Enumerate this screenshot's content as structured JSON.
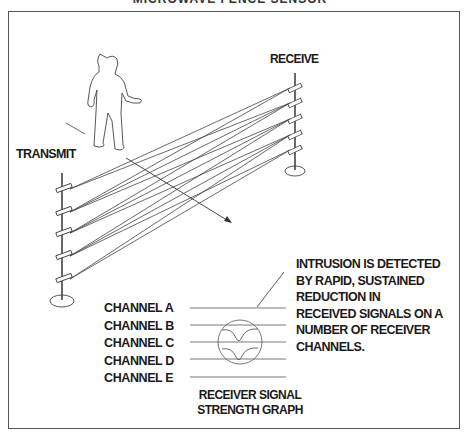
{
  "figure": {
    "title_partial": "MICROWAVE FENCE SENSOR",
    "labels": {
      "receive": "RECEIVE",
      "transmit": "TRANSMIT"
    },
    "channels": [
      {
        "label": "CHANNEL A"
      },
      {
        "label": "CHANNEL B"
      },
      {
        "label": "CHANNEL C"
      },
      {
        "label": "CHANNEL D"
      },
      {
        "label": "CHANNEL E"
      }
    ],
    "annotation": {
      "lines": [
        "INTRUSION IS DETECTED",
        "BY RAPID, SUSTAINED",
        "REDUCTION IN",
        "RECEIVED SIGNALS ON A",
        "NUMBER OF RECEIVER",
        "CHANNELS."
      ]
    },
    "caption": {
      "line1": "RECEIVER SIGNAL",
      "line2": "STRENGTH GRAPH"
    },
    "colors": {
      "line": "#444444",
      "text": "#1a1a1a",
      "frame": "#555555"
    }
  }
}
